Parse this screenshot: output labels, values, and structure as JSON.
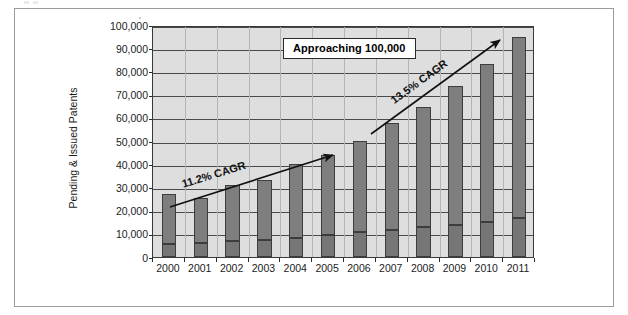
{
  "chart_data": {
    "type": "bar",
    "subtype": "stacked-bar",
    "title": "",
    "xlabel": "",
    "ylabel": "Pending & Issued Patents",
    "ylim": [
      0,
      100000
    ],
    "ytick_step": 10000,
    "ytick_labels": [
      "0",
      "10,000",
      "20,000",
      "30,000",
      "40,000",
      "50,000",
      "60,000",
      "70,000",
      "80,000",
      "90,000",
      "100,000"
    ],
    "grid": true,
    "legend": "none",
    "categories": [
      "2000",
      "2001",
      "2002",
      "2003",
      "2004",
      "2005",
      "2006",
      "2007",
      "2008",
      "2009",
      "2010",
      "2011"
    ],
    "series": [
      {
        "name": "Issued Patents",
        "stack_position": "bottom",
        "values": [
          5800,
          6200,
          6800,
          7300,
          8200,
          9300,
          10800,
          11500,
          12800,
          14000,
          15300,
          16900
        ]
      },
      {
        "name": "Pending Patents",
        "stack_position": "top",
        "values": [
          21200,
          19100,
          24200,
          26000,
          31800,
          34600,
          39200,
          46400,
          51700,
          59700,
          67800,
          78100
        ]
      }
    ],
    "totals": [
      27000,
      25300,
      31000,
      33300,
      40000,
      43900,
      50000,
      57900,
      64500,
      73700,
      83100,
      95000
    ],
    "annotations": [
      {
        "name": "cagr-early",
        "text": "11.2% CAGR",
        "type": "arrow-label",
        "arrow_from": [
          "2000",
          31000
        ],
        "arrow_to": [
          "2006",
          50500
        ]
      },
      {
        "name": "cagr-late",
        "text": "13.5% CAGR",
        "type": "arrow-label",
        "arrow_from": [
          "2006",
          56000
        ],
        "arrow_to": [
          "2011",
          97000
        ]
      },
      {
        "name": "approaching-callout",
        "text": "Approaching 100,000",
        "type": "callout-box"
      }
    ],
    "colors": {
      "plot_background": "#dedede",
      "bar_fill": "#7e7e7e",
      "bar_outline": "#3d3d3d",
      "gridline": "#4a4a4a",
      "axis_text": "#1c1c1c",
      "callout_background": "#ffffff",
      "callout_border": "#2b2b2b",
      "figure_border": "#9b9b9b"
    }
  }
}
